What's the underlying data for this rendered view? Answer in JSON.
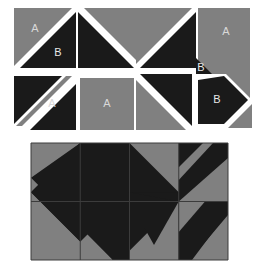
{
  "figure": {
    "title": "",
    "background_color": "#ffffff",
    "gray_color": "#808080",
    "dark_color": "#1a1a1a",
    "line_color": "#3c3c3c",
    "label_color": "#d8d8d8"
  },
  "pieces": {
    "caption": "",
    "row1": [
      {
        "id": "piece-1",
        "shape": "square-split-diagonal-tl-br",
        "labels": [
          {
            "text": "A",
            "region": "gray-upper-left"
          },
          {
            "text": "B",
            "region": "dark-lower-right"
          }
        ]
      },
      {
        "id": "piece-2",
        "shape": "square-split-diagonal-bl-tr",
        "labels": []
      },
      {
        "id": "piece-3",
        "shape": "square-split-diagonal-tl-br",
        "labels": []
      },
      {
        "id": "piece-4",
        "shape": "gray-square-with-corner-triangle",
        "labels": [
          {
            "text": "A",
            "region": "gray-square"
          },
          {
            "text": "B",
            "region": "dark-corner-triangle"
          }
        ]
      }
    ],
    "row2": [
      {
        "id": "piece-5",
        "shape": "square-with-diagonal-gray-band",
        "labels": [
          {
            "text": "A",
            "region": "gray-band"
          }
        ]
      },
      {
        "id": "piece-6",
        "shape": "plain-gray-square",
        "labels": [
          {
            "text": "A",
            "region": "gray-square"
          }
        ]
      },
      {
        "id": "piece-7",
        "shape": "square-split-diagonal-bl-tr-inverted",
        "labels": []
      },
      {
        "id": "piece-8",
        "shape": "dark-arrow-pentagon",
        "labels": [
          {
            "text": "B",
            "region": "dark-pentagon"
          }
        ]
      }
    ]
  },
  "composite": {
    "caption": "",
    "columns": 4,
    "rows": 2,
    "cells": [
      {
        "r": 0,
        "c": 0,
        "pattern": "gray-with-dark-lower-right-wedge"
      },
      {
        "r": 0,
        "c": 1,
        "pattern": "dark-with-gray-right-wedge"
      },
      {
        "r": 0,
        "c": 2,
        "pattern": "plain-gray"
      },
      {
        "r": 0,
        "c": 3,
        "pattern": "dark-band-diagonal-on-gray"
      },
      {
        "r": 1,
        "c": 0,
        "pattern": "gray-with-dark-upper-right-wedge"
      },
      {
        "r": 1,
        "c": 1,
        "pattern": "dark-with-gray-lower-left-wedge"
      },
      {
        "r": 1,
        "c": 2,
        "pattern": "gray-with-dark-triangle-down"
      },
      {
        "r": 1,
        "c": 3,
        "pattern": "dark-band-diagonal-on-gray-lower"
      }
    ]
  }
}
